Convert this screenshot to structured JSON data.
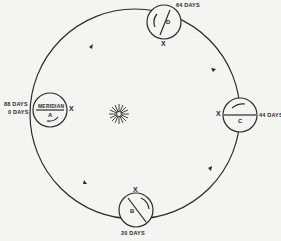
{
  "diagram": {
    "center_symbol": "sun-icon",
    "orbit_direction": "counter-clockwise",
    "positions": [
      {
        "id": "A",
        "name": "MERIDIAN",
        "letter": "A",
        "labels": [
          "88 DAYS",
          "0 DAYS"
        ],
        "marker": "X"
      },
      {
        "id": "B",
        "letter": "B",
        "labels": [
          "20 DAYS"
        ],
        "marker": "X"
      },
      {
        "id": "C",
        "letter": "C",
        "labels": [
          "44 DAYS"
        ],
        "marker": "X"
      },
      {
        "id": "D",
        "letter": "D",
        "labels": [
          "64 DAYS"
        ],
        "marker": "X"
      }
    ]
  },
  "colors": {
    "line": "#2a2a2a",
    "background": "#f4f4f2"
  }
}
